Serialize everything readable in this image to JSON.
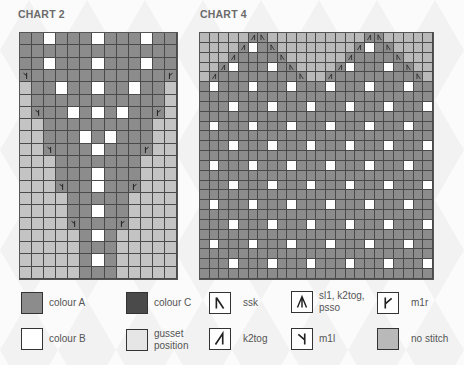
{
  "charts": [
    {
      "title": "CHART 2",
      "cols": 13,
      "rows": [
        "AAWAAAWAAAWAA",
        "AAAAAAAAAAAAA",
        "AAWAAAWAAAWAA",
        "LAAAAAAAAAAAR",
        "GAAWAAWAAWAAG",
        "GAAAAAAAAAAAG",
        "GLAAWAWAWAARG",
        "GGAAAAAAAAAGG",
        "GGAAAWAWAAAGG",
        "GGLAAAWAAARGG",
        "GGGAAAAAAAGGG",
        "GGGAAAWAAAGGG",
        "GGGLAAWAARGGG",
        "GGGGAAAAAGGGG",
        "GGGGAAWAAGGGG",
        "GGGGLAAARGGGG",
        "GGGGGAWAGGGGG",
        "GGGGGAAAGGGGG",
        "GGGGGAWAGGGGG",
        "GGGGGAAAGGGGG"
      ]
    },
    {
      "title": "CHART 4",
      "cols": 24,
      "rows": [
        "NNNNNkSNNNNNNNNNNkSNNNNN",
        "NNNNKWAsNNNNNNNNKWAsNNNN",
        "NNNKAAAAsNNNNNNKAAAAsNNN",
        "NNKWAAAWAsNNNNKWAAAWAsNN",
        "NKAAAAAAAAsNNKAAAAAAAAsN",
        "AWAAAWAAAWAAAWAAAWAAAWAA",
        "AAAAAAAAAAAAAAAAAAAAAAAA",
        "AAAWAAAWAAAWAAAWAAAWAAAW",
        "AAAAAAAAAAAAAAAAAAAAAAAA",
        "AWAAAWAAAWAAAWAAAWAAAWAA",
        "AAAAAAAAAAAAAAAAAAAAAAAA",
        "AAAWAAAWAAAWAAAWAAAWAAAW",
        "AAAAAAAAAAAAAAAAAAAAAAAA",
        "AWAAAWAAAWAAAWAAAWAAAWAA",
        "AAAAAAAAAAAAAAAAAAAAAAAA",
        "AAAWAAAWAAAWAAAWAAAWAAAW",
        "AAAAAAAAAAAAAAAAAAAAAAAA",
        "AWAAAWAAAWAAAWAAAWAAAWAA",
        "AAAAAAAAAAAAAAAAAAAAAAAA",
        "AAAWAAAWAAAWAAAWAAAWAAAW",
        "AAAAAAAAAAAAAAAAAAAAAAAA",
        "AWAAAWAAAWAAAWAAAWAAAWAA",
        "AAAAAAAAAAAAAAAAAAAAAAAA",
        "AAAWAAAWAAAWAAAWAAAWAAAW",
        "AAAAAAAAAAAAAAAAAAAAAAAA"
      ]
    }
  ],
  "cell_codes": {
    "A": "colour A",
    "W": "colour B",
    "G": "gusset position",
    "N": "no stitch",
    "L": "m1l on colour A",
    "R": "m1r on colour A",
    "K": "k2tog on colour A",
    "s": "ssk on colour A",
    "k": "sl1, k2tog, psso (left half)",
    "S": "sl1, k2tog, psso (right half)"
  },
  "colors": {
    "colour_A": "#8c8c8c",
    "colour_B": "#ffffff",
    "colour_C": "#4a4a4a",
    "gusset": "#c4c4c4",
    "no_stitch": "#b9b9b9",
    "grid_line": "#4a4a4a"
  },
  "legend": [
    {
      "key": "colour-a",
      "label": "colour A",
      "type": "swatch",
      "color": "#8c8c8c"
    },
    {
      "key": "colour-c",
      "label": "colour C",
      "type": "swatch",
      "color": "#4a4a4a"
    },
    {
      "key": "ssk",
      "label": "ssk",
      "type": "symbol",
      "icon": "ssk-icon"
    },
    {
      "key": "sl1-k2tog-psso",
      "label": "sl1, k2tog, psso",
      "type": "symbol",
      "icon": "sl1-k2tog-psso-icon"
    },
    {
      "key": "m1r",
      "label": "m1r",
      "type": "symbol",
      "icon": "m1r-icon"
    },
    {
      "key": "colour-b",
      "label": "colour B",
      "type": "swatch",
      "color": "#ffffff"
    },
    {
      "key": "gusset-position",
      "label": "gusset position",
      "type": "swatch",
      "color": "#e6e6e6"
    },
    {
      "key": "k2tog",
      "label": "k2tog",
      "type": "symbol",
      "icon": "k2tog-icon"
    },
    {
      "key": "m1l",
      "label": "m1l",
      "type": "symbol",
      "icon": "m1l-icon"
    },
    {
      "key": "no-stitch",
      "label": "no stitch",
      "type": "swatch",
      "color": "#b9b9b9"
    }
  ]
}
